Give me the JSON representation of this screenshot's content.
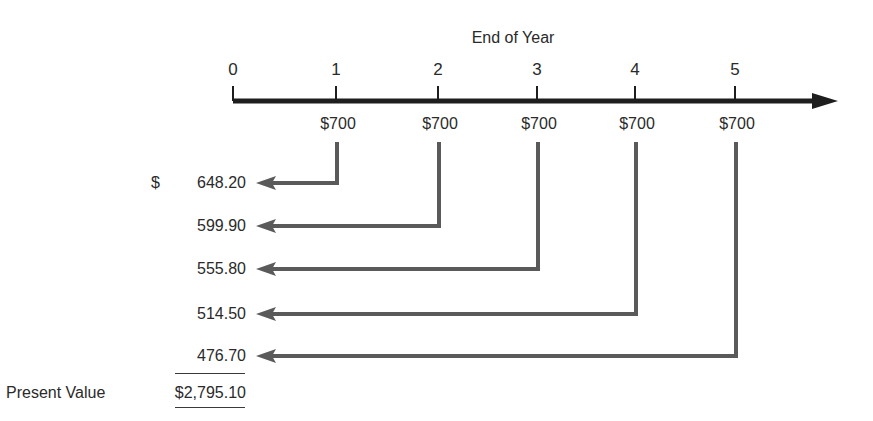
{
  "diagram": {
    "title": "End of Year",
    "timeline": {
      "years": [
        "0",
        "1",
        "2",
        "3",
        "4",
        "5"
      ],
      "cash_flows": [
        "$700",
        "$700",
        "$700",
        "$700",
        "$700"
      ]
    },
    "present_values": {
      "currency_symbol": "$",
      "items": [
        "648.20",
        "599.90",
        "555.80",
        "514.50",
        "476.70"
      ],
      "total_label": "Present Value",
      "total_value": "$2,795.10"
    },
    "colors": {
      "axis": "#1e1e1e",
      "arrows": "#5a5a5a",
      "text": "#2a2a2a"
    }
  }
}
